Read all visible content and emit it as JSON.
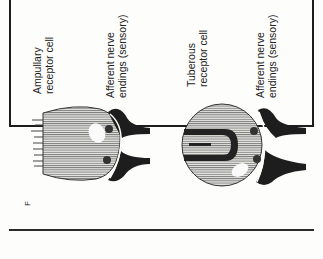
{
  "figure": {
    "panel_letter": "F",
    "cells": [
      {
        "name": "ampullary",
        "label_line1": "Ampullary",
        "label_line2": "receptor cell",
        "nerve_label_line1": "Afferent nerve",
        "nerve_label_line2": "endings (sensory)"
      },
      {
        "name": "tuberous",
        "label_line1": "Tuberous",
        "label_line2": "receptor cell",
        "nerve_label_line1": "Afferent nerve",
        "nerve_label_line2": "endings (sensory)"
      }
    ],
    "colors": {
      "ink": "#1d1d1d",
      "hatch": "#555555",
      "cell_fill": "#e4e4e0",
      "background": "#fdfdfb"
    }
  }
}
